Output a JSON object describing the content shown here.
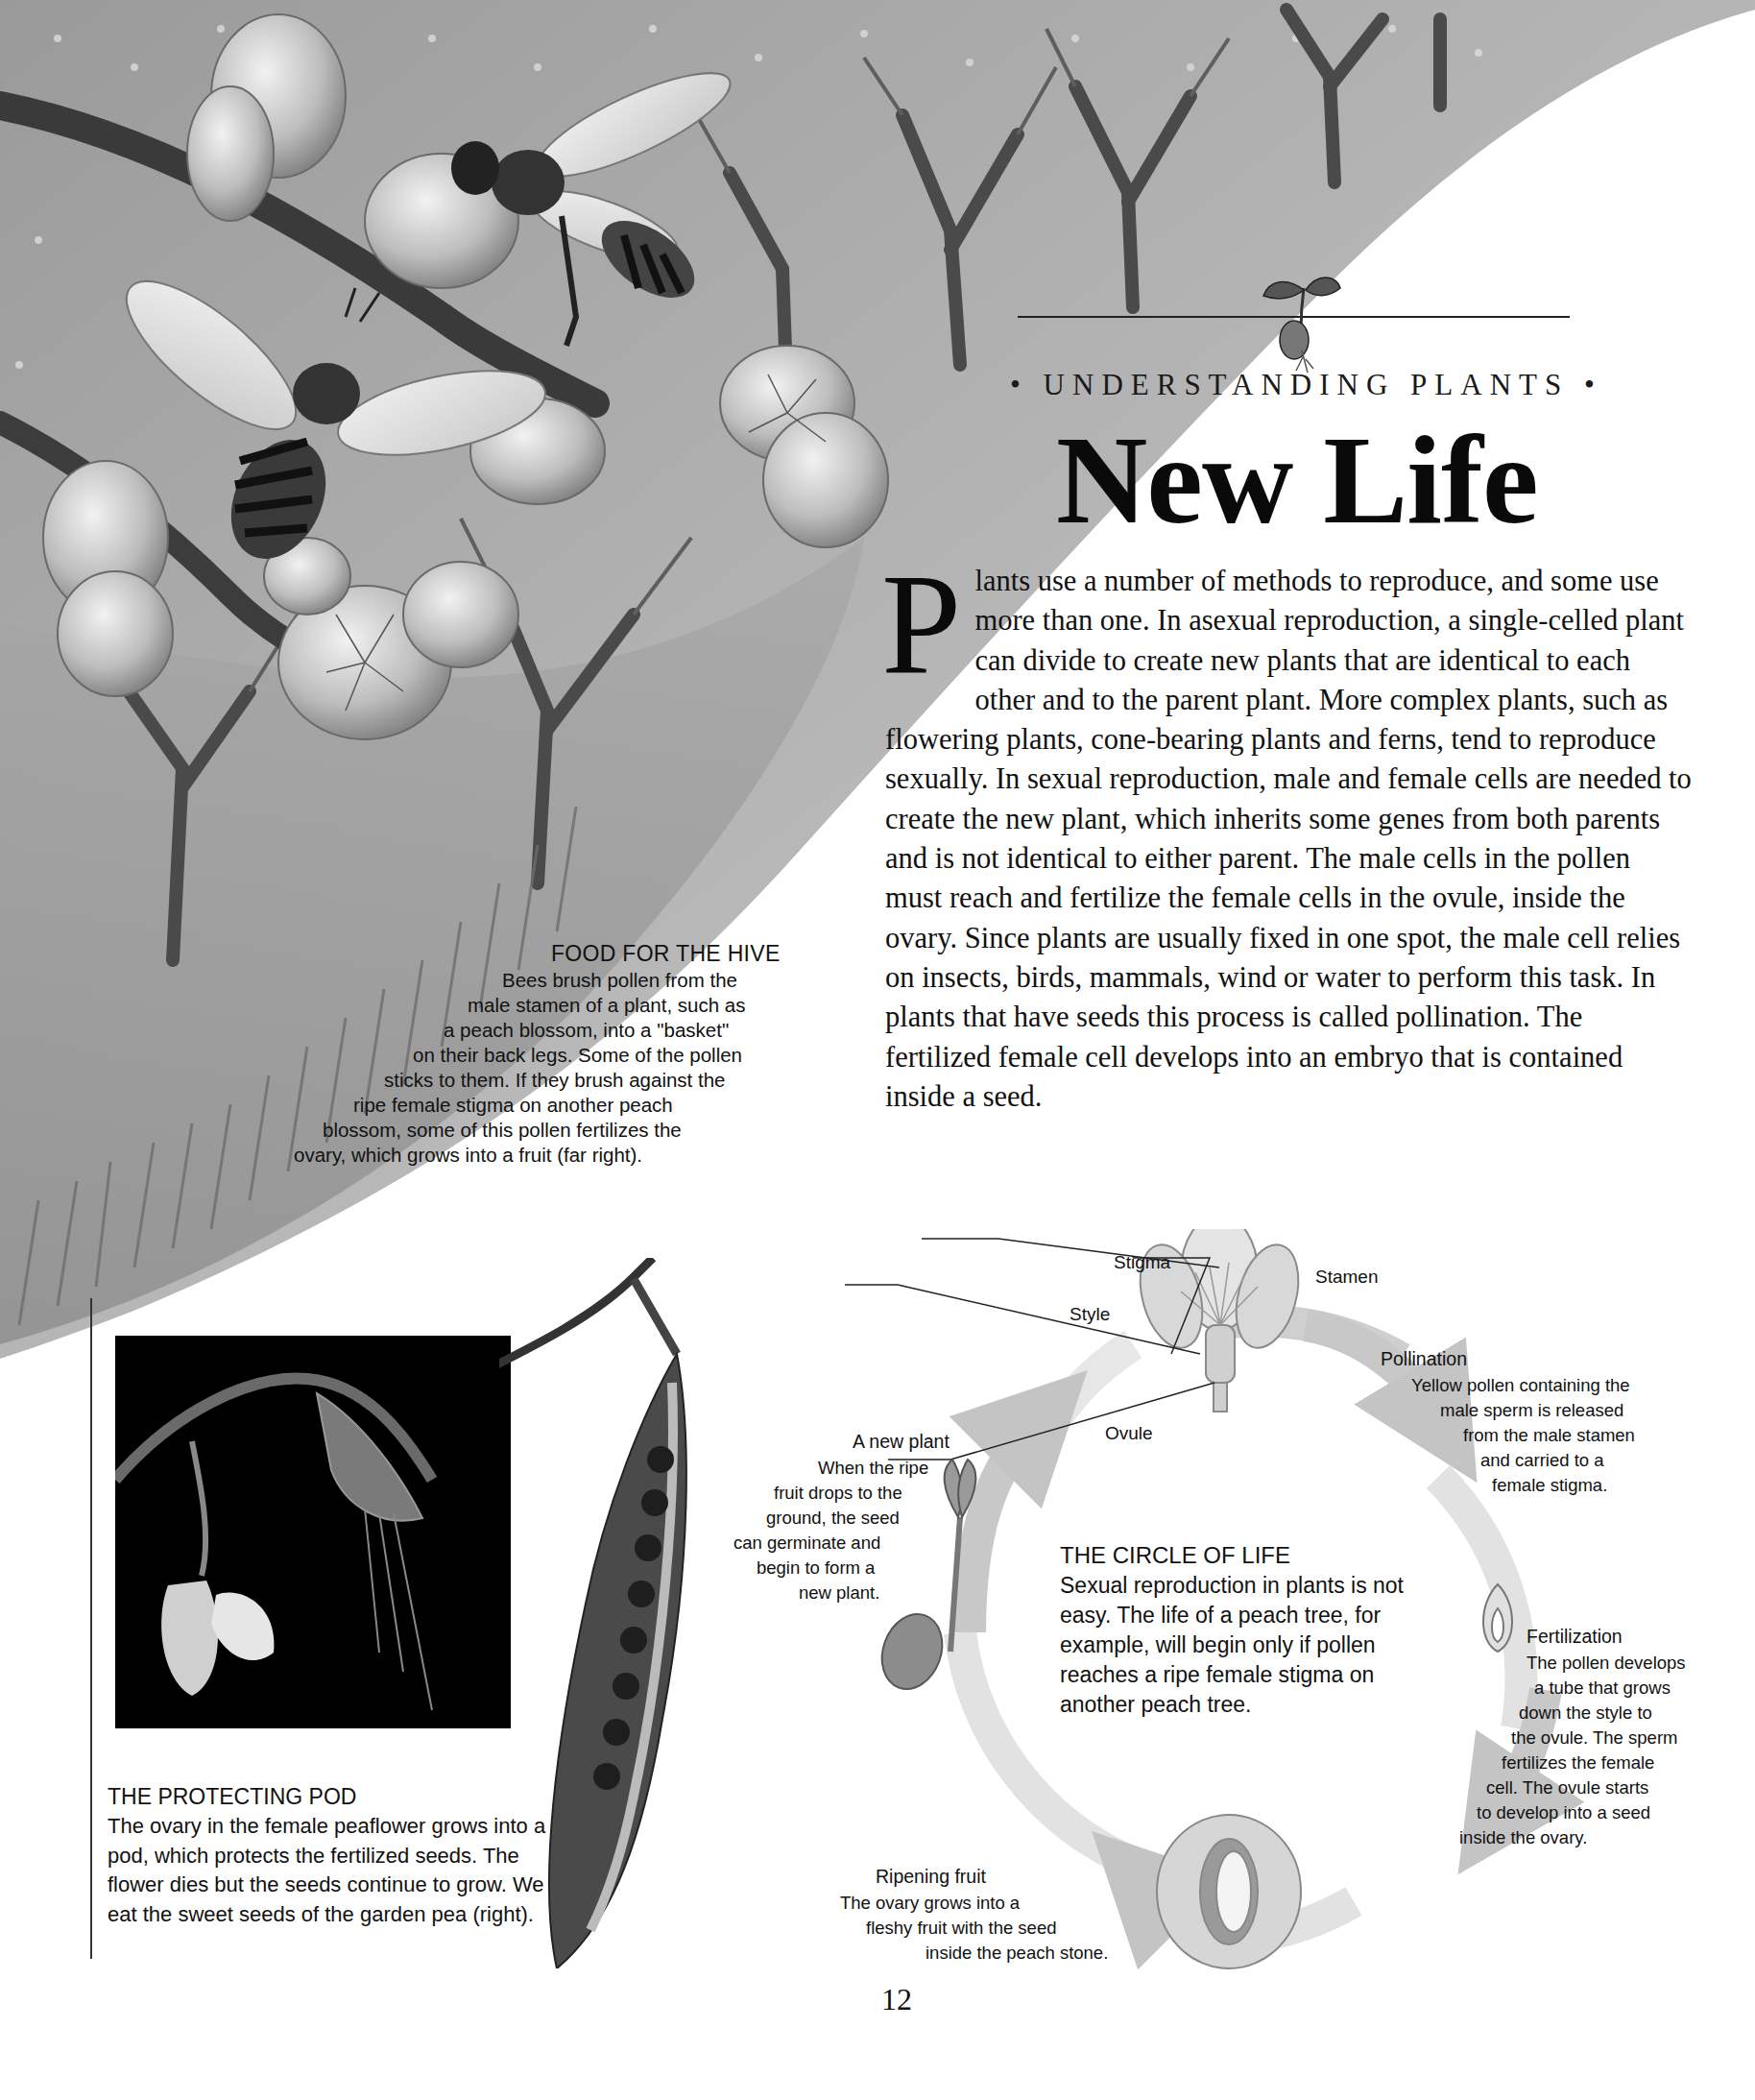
{
  "header": {
    "kicker": "• UNDERSTANDING PLANTS •",
    "title": "New Life"
  },
  "intro": {
    "dropcap": "P",
    "text": "lants use a number of methods to reproduce, and some use more than one. In asexual reproduction, a single-celled plant can divide to create new plants that are identical to each other and to the parent plant. More complex plants, such as flowering plants, cone-bearing plants and ferns, tend to reproduce sexually. In sexual reproduction, male and female cells are needed to create the new plant, which inherits some genes from both parents and is not identical to either parent. The male cells in the pollen must reach and fertilize the female cells in the ovule, inside the ovary. Since plants are usually fixed in one spot, the male cell relies on insects, birds, mammals, wind or water to perform this task. In plants that have seeds this process is called pollination. The fertilized female cell develops into an embryo that is contained inside a seed."
  },
  "hive_caption": {
    "title": "FOOD FOR THE HIVE",
    "lines": [
      "Bees brush pollen from the",
      "male stamen of a plant, such as",
      "a peach blossom, into a \"basket\"",
      "on their back legs. Some of the pollen",
      "sticks to them. If they brush against the",
      "ripe female stigma on another peach",
      "blossom, some of this pollen fertilizes the",
      "ovary, which grows into a fruit (far right)."
    ]
  },
  "pod_caption": {
    "title": "THE PROTECTING POD",
    "body": "The ovary in the female peaflower grows into a pod, which protects the fertilized seeds. The flower dies but the seeds continue to grow. We eat the sweet seeds of the garden pea (right)."
  },
  "flower_labels": {
    "stigma": "Stigma",
    "stamen": "Stamen",
    "style": "Style",
    "ovule": "Ovule"
  },
  "cycle": {
    "center_title": "THE CIRCLE OF LIFE",
    "center_body": "Sexual reproduction in plants is not easy. The life of a peach tree, for example, will begin only if pollen reaches a ripe female stigma on another peach tree.",
    "stages": [
      {
        "title": "Pollination",
        "lines": [
          "Yellow pollen containing the",
          "male sperm is released",
          "from the male stamen",
          "and carried to a",
          "female stigma."
        ]
      },
      {
        "title": "Fertilization",
        "lines": [
          "The pollen develops",
          "a tube that grows",
          "down the style to",
          "the ovule. The sperm",
          "fertilizes the female",
          "cell. The ovule starts",
          "to develop into a seed",
          "inside the ovary."
        ]
      },
      {
        "title": "Ripening fruit",
        "lines": [
          "The ovary grows into a",
          "fleshy fruit with the seed",
          "inside the peach stone."
        ]
      },
      {
        "title": "A new plant",
        "lines": [
          "When the ripe",
          "fruit drops to the",
          "ground, the seed",
          "can germinate and",
          "begin to form a",
          "new plant."
        ]
      }
    ]
  },
  "page_number": "12"
}
